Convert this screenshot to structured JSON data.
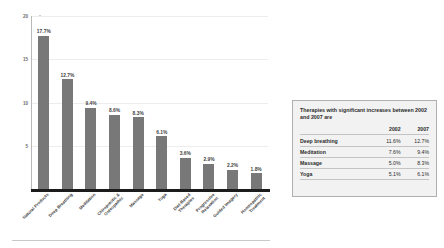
{
  "chart_data": {
    "type": "bar",
    "title": "",
    "xlabel": "",
    "ylabel": "Percentage",
    "ylim": [
      0,
      20
    ],
    "yticks": [
      5,
      10,
      15,
      20
    ],
    "grid": true,
    "legend": "none",
    "categories": [
      "Natural Products",
      "Deep Breathing",
      "Meditation",
      "Chiropractic &\nOsteopathic",
      "Massage",
      "Yoga",
      "Diet-Based\nTherapies",
      "Progressive\nRelaxation",
      "Guided Imagery",
      "Homeopathic\nTreatment"
    ],
    "values": [
      17.7,
      12.7,
      9.4,
      8.6,
      8.3,
      6.1,
      3.6,
      2.9,
      2.2,
      1.8
    ],
    "value_labels": [
      "17.7%",
      "12.7%",
      "9.4%",
      "8.6%",
      "8.3%",
      "6.1%",
      "3.6%",
      "2.9%",
      "2.2%",
      "1.8%"
    ],
    "bar_color": "#787878"
  },
  "side_table": {
    "caption": "Therapies with significant increases between 2002 and 2007 are",
    "columns": [
      "",
      "2002",
      "2007"
    ],
    "rows": [
      {
        "therapy": "Deep breathing",
        "y2002": "11.6%",
        "y2007": "12.7%"
      },
      {
        "therapy": "Meditation",
        "y2002": "7.6%",
        "y2007": "9.4%"
      },
      {
        "therapy": "Massage",
        "y2002": "5.0%",
        "y2007": "8.3%"
      },
      {
        "therapy": "Yoga",
        "y2002": "5.1%",
        "y2007": "6.1%"
      }
    ]
  }
}
